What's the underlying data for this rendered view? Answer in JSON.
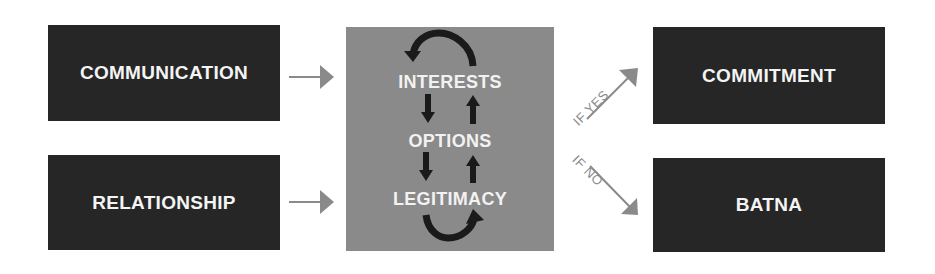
{
  "inputs": [
    {
      "label": "COMMUNICATION"
    },
    {
      "label": "RELATIONSHIP"
    }
  ],
  "process": {
    "items": [
      {
        "label": "INTERESTS"
      },
      {
        "label": "OPTIONS"
      },
      {
        "label": "LEGITIMACY"
      }
    ]
  },
  "conditions": {
    "yes": "IF YES",
    "no": "IF NO"
  },
  "outputs": [
    {
      "label": "COMMITMENT"
    },
    {
      "label": "BATNA"
    }
  ],
  "colors": {
    "dark_box": "#262626",
    "center_box": "#8a8a8a",
    "arrow": "#8a8a8a",
    "cycle_arrow": "#1a1a1a",
    "text": "#f4f4f4"
  }
}
